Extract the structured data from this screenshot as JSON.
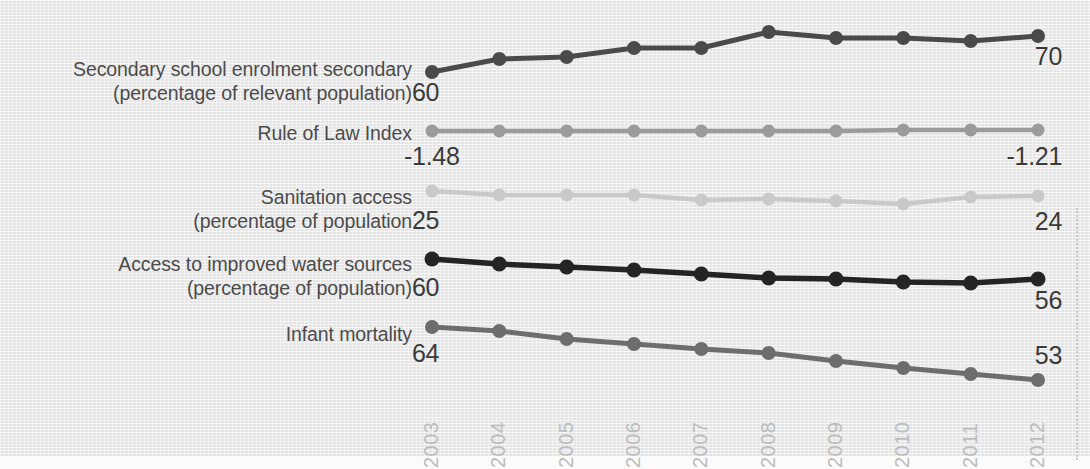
{
  "background": {
    "paper_color": "#eaeaea",
    "bottom_band_color": "#fbfbfb"
  },
  "axis": {
    "years": [
      "2003",
      "2004",
      "2005",
      "2006",
      "2007",
      "2008",
      "2009",
      "2010",
      "2011",
      "2012"
    ],
    "year_label_color": "#bdbdbd"
  },
  "divider": {
    "name": "dotted-vertical-rule",
    "color": "#c9c9c9"
  },
  "series": [
    {
      "label": "Secondary school enrolment secondary\n(percentage of relevant population)",
      "label_line1": "Secondary school enrolment secondary",
      "label_line2": "(percentage of relevant population)",
      "start_value": "60",
      "end_value": "70",
      "color": "#4a4a4a"
    },
    {
      "label": "Rule of Law Index",
      "label_line1": "Rule of Law Index",
      "label_line2": "",
      "start_value": "-1.48",
      "end_value": "-1.21",
      "color": "#9b9b9b"
    },
    {
      "label": "Sanitation access\n(percentage of population",
      "label_line1": "Sanitation access",
      "label_line2": "(percentage of population",
      "start_value": "25",
      "end_value": "24",
      "color": "#c9c9c9"
    },
    {
      "label": "Access to improved water sources\n(percentage of population)",
      "label_line1": "Access to improved water sources",
      "label_line2": "(percentage of population)",
      "start_value": "60",
      "end_value": "56",
      "color": "#242424"
    },
    {
      "label": "Infant mortality",
      "label_line1": "Infant mortality",
      "label_line2": "",
      "start_value": "64",
      "end_value": "53",
      "color": "#6d6d6d"
    }
  ],
  "chart_data": {
    "type": "line",
    "title": "",
    "xlabel": "",
    "ylabel": "",
    "grid": false,
    "legend": "row-labels-left",
    "x": [
      "2003",
      "2004",
      "2005",
      "2006",
      "2007",
      "2008",
      "2009",
      "2010",
      "2011",
      "2012"
    ],
    "note": "Five independent sparklines sharing the same year axis; each has its own y-scale with only first and last values labelled.",
    "series": [
      {
        "name": "Secondary school enrolment secondary (percentage of relevant population)",
        "color": "#4a4a4a",
        "start_label": "60",
        "end_label": "70",
        "values": [
          60,
          63,
          63.5,
          66,
          66,
          70.5,
          69,
          69,
          68.5,
          70
        ],
        "pixel_y": [
          72,
          59,
          57,
          48,
          48,
          32,
          38,
          38,
          41,
          36
        ]
      },
      {
        "name": "Rule of Law Index",
        "color": "#9b9b9b",
        "start_label": "-1.48",
        "end_label": "-1.21",
        "values": [
          -1.48,
          -1.46,
          -1.45,
          -1.44,
          -1.42,
          -1.4,
          -1.34,
          -1.29,
          -1.24,
          -1.21
        ],
        "pixel_y": [
          131,
          131,
          131,
          131,
          131,
          131,
          131,
          130,
          130,
          130
        ]
      },
      {
        "name": "Sanitation access (percentage of population",
        "color": "#c9c9c9",
        "start_label": "25",
        "end_label": "24",
        "values": [
          25,
          24.7,
          24.7,
          24.7,
          24.2,
          24.3,
          24.1,
          23.8,
          24.4,
          24
        ],
        "pixel_y": [
          191,
          195,
          195,
          195,
          200,
          199,
          201,
          204,
          197,
          196
        ]
      },
      {
        "name": "Access to improved water sources (percentage of population)",
        "color": "#242424",
        "start_label": "60",
        "end_label": "56",
        "values": [
          60,
          59.4,
          59.0,
          58.6,
          58.0,
          57.4,
          57.2,
          56.8,
          56.6,
          56
        ],
        "pixel_y": [
          259,
          264,
          267,
          270,
          274,
          278,
          279,
          282,
          283,
          279
        ]
      },
      {
        "name": "Infant mortality",
        "color": "#6d6d6d",
        "start_label": "64",
        "end_label": "53",
        "values": [
          64,
          63.0,
          61.5,
          60.5,
          59.5,
          58.5,
          57.0,
          55.5,
          54.2,
          53
        ],
        "pixel_y": [
          327,
          331,
          339,
          344,
          349,
          353,
          361,
          368,
          374,
          380
        ]
      }
    ]
  }
}
